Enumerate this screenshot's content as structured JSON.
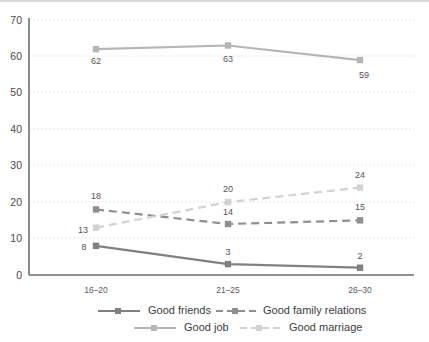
{
  "chart_data": {
    "type": "line",
    "title": "",
    "subtitle": "",
    "xlabel": "",
    "ylabel": "",
    "categories": [
      "16–20",
      "21–25",
      "26–30"
    ],
    "ylim": [
      0,
      70
    ],
    "yticks": [
      "0",
      "10",
      "20",
      "30",
      "40",
      "50",
      "60",
      "70"
    ],
    "ytick_values": [
      0,
      10,
      20,
      30,
      40,
      50,
      60,
      70
    ],
    "grid": true,
    "legend_position": "bottom",
    "series": [
      {
        "name": "Good friends",
        "values": [
          8,
          3,
          2
        ],
        "labels": [
          "8",
          "3",
          "2"
        ],
        "color": "#808080",
        "dash": "solid",
        "marker": "square"
      },
      {
        "name": "Good family relations",
        "values": [
          18,
          14,
          15
        ],
        "labels": [
          "18",
          "14",
          "15"
        ],
        "color": "#8f8f8f",
        "dash": "dashed",
        "marker": "square"
      },
      {
        "name": "Good job",
        "values": [
          62,
          63,
          59
        ],
        "labels": [
          "62",
          "63",
          "59"
        ],
        "color": "#b5b5b5",
        "dash": "solid",
        "marker": "square"
      },
      {
        "name": "Good marriage",
        "values": [
          13,
          20,
          24
        ],
        "labels": [
          "13",
          "20",
          "24"
        ],
        "color": "#d2d2d2",
        "dash": "dashed",
        "marker": "square"
      }
    ]
  },
  "axis": {
    "y_ticks": [
      "70",
      "60",
      "50",
      "40",
      "30",
      "20",
      "10",
      "0"
    ],
    "x_categories": [
      "16–20",
      "21–25",
      "26–30"
    ]
  },
  "legend": {
    "row1": [
      {
        "label": "Good friends",
        "color": "#808080",
        "dash": "solid"
      },
      {
        "label": "Good family relations",
        "color": "#8f8f8f",
        "dash": "dashed"
      }
    ],
    "row2": [
      {
        "label": "Good job",
        "color": "#b5b5b5",
        "dash": "solid"
      },
      {
        "label": "Good marriage",
        "color": "#d2d2d2",
        "dash": "dashed"
      }
    ]
  },
  "colors": {
    "grid": "#e6e6e6",
    "axis": "#6e6e6e",
    "top_rule": "#d9d9d9",
    "text": "#4a4a4a",
    "background": "#ffffff"
  }
}
